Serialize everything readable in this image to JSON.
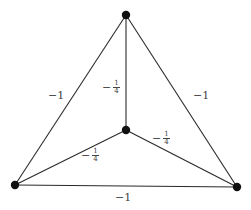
{
  "graph": {
    "nodes": [
      {
        "id": "top",
        "x": 126,
        "y": 15
      },
      {
        "id": "center",
        "x": 126,
        "y": 130
      },
      {
        "id": "bottom-left",
        "x": 15,
        "y": 185
      },
      {
        "id": "bottom-right",
        "x": 237,
        "y": 187
      }
    ],
    "edges": [
      {
        "from": "top",
        "to": "bottom-left",
        "weight": "−1",
        "label_minus": "−",
        "label_value": "1"
      },
      {
        "from": "top",
        "to": "bottom-right",
        "weight": "−1",
        "label_minus": "−",
        "label_value": "1"
      },
      {
        "from": "bottom-left",
        "to": "bottom-right",
        "weight": "−1",
        "label_minus": "−",
        "label_value": "1"
      },
      {
        "from": "top",
        "to": "center",
        "weight": "−1/4",
        "label_minus": "−",
        "num": "1",
        "den": "4"
      },
      {
        "from": "center",
        "to": "bottom-right",
        "weight": "−1/4",
        "label_minus": "−",
        "num": "1",
        "den": "4"
      },
      {
        "from": "center",
        "to": "bottom-left",
        "weight": "−1/4",
        "label_minus": "−",
        "num": "1",
        "den": "4"
      }
    ]
  },
  "colors": {
    "edge": "#2a2a2a",
    "node": "#111111",
    "label": "#444444"
  }
}
